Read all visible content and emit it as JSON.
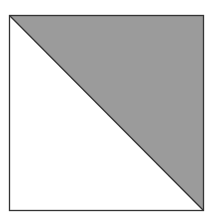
{
  "diagram": {
    "shape": "square-split-diagonal",
    "square": {
      "x": 9.5,
      "y": 15.5,
      "width": 194,
      "height": 195
    },
    "diagonal": {
      "from": "top-left",
      "to": "bottom-right"
    },
    "colors": {
      "background": "#ffffff",
      "shaded_fill": "#9b9b9b",
      "unshaded_fill": "#ffffff",
      "stroke": "#333333"
    },
    "regions": [
      {
        "name": "upper-right-triangle",
        "fill": "shaded"
      },
      {
        "name": "lower-left-triangle",
        "fill": "unshaded"
      }
    ]
  }
}
